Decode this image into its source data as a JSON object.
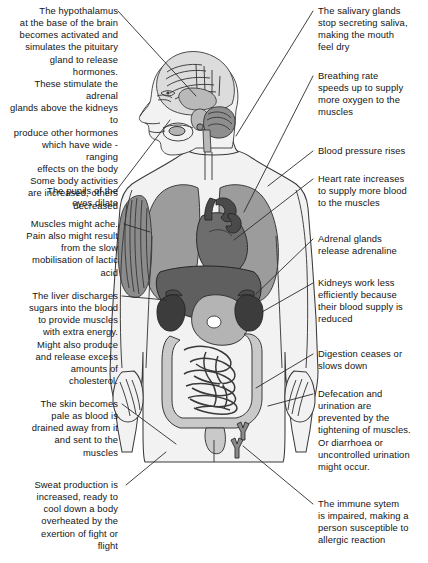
{
  "diagram": {
    "figure_label": "human-body-anatomical-figure"
  },
  "notes": {
    "hypothalamus": "The hypothalamus\nat the base of the brain\nbecomes activated and\nsimulates the pituitary\ngland to release hormones.\nThese stimulate the adrenal\nglands above the kidneys to\nproduce other hormones\nwhich have wide - ranging\neffects on the body\nSome body activities\nare increased, others\ndecreased",
    "pupils": "The pupils of the\neyes dilate",
    "muscles": "Muscles might ache.\nPain also might result\nfrom the slow\nmobilisation of lactic\nacid",
    "liver": "The liver discharges\nsugars into the blood\nto provide muscles\nwith extra energy.\nMight also produce\nand release excess\namounts of\ncholesterol.",
    "skin": "The skin becomes\npale as blood is\ndrained away from it\nand sent to the\nmuscles",
    "sweat": "Sweat production is\nincreased, ready to\ncool down a body\noverheated by the\nexertion of fight or\nflight",
    "salivary": "The salivary glands\nstop secreting saliva,\nmaking the mouth\nfeel dry",
    "breathing": "Breathing rate\nspeeds up to supply\nmore oxygen to the\nmuscles",
    "blood_pressure": "Blood pressure rises",
    "heart_rate": "Heart rate increases\nto supply more blood\nto the muscles",
    "adrenal": "Adrenal glands\nrelease adrenaline",
    "kidneys": "Kidneys work less\nefficiently because\ntheir blood supply is\nreduced",
    "digestion": "Digestion ceases or\nslows down",
    "defecation": "Defecation and\nurination are\nprevented by the\ntightening of muscles.\nOr diarrhoea or\nuncontrolled urination\nmight occur.",
    "immune": "The immune sytem\nis impaired, making a\nperson susceptible to\nallergic reaction"
  },
  "colors": {
    "background": "#ffffff",
    "text": "#141414",
    "leader_line": "#2b2b2b",
    "body_fill": "#f2f2f2",
    "outline": "#3a3a3a",
    "lung": "#9c9c9c",
    "heart": "#6d6d6d",
    "liver": "#5f5f5f",
    "stomach": "#b4b4b4",
    "kidney": "#3c3c3c",
    "intestine": "#c9c9c9",
    "brain": "#dcdcdc",
    "muscle": "#8b8b8b"
  }
}
